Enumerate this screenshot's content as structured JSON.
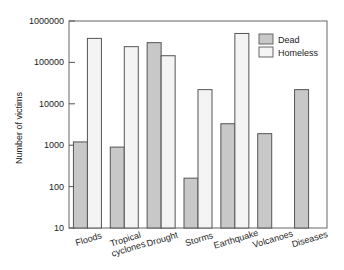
{
  "chart_data": {
    "type": "bar",
    "title": "",
    "xlabel": "",
    "ylabel": "Number of victims",
    "yscale": "log",
    "ylim": [
      10,
      1000000
    ],
    "yticks": [
      10,
      100,
      1000,
      10000,
      100000,
      1000000
    ],
    "ytick_labels": [
      "10",
      "100",
      "1000",
      "10000",
      "100000",
      "1000000"
    ],
    "categories": [
      "Floods",
      "Tropical cyclones",
      "Drought",
      "Storms",
      "Earthquake",
      "Volcanoes",
      "Diseases"
    ],
    "category_label_lines": [
      [
        "Floods"
      ],
      [
        "Tropical",
        "cyclones"
      ],
      [
        "Drought"
      ],
      [
        "Storms"
      ],
      [
        "Earthquake"
      ],
      [
        "Volcanoes"
      ],
      [
        "Diseases"
      ]
    ],
    "series": [
      {
        "name": "Dead",
        "color": "#c8c8c8",
        "values": [
          1200,
          900,
          300000,
          160,
          3300,
          1900,
          22000
        ]
      },
      {
        "name": "Homeless",
        "color": "#f4f4f4",
        "values": [
          380000,
          240000,
          145000,
          22000,
          500000,
          null,
          null
        ]
      }
    ],
    "legend": {
      "position": "upper right",
      "entries": [
        "Dead",
        "Homeless"
      ]
    },
    "grid": false
  }
}
